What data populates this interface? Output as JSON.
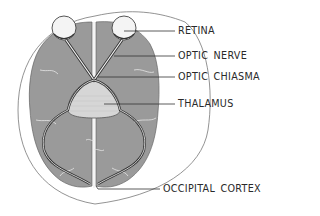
{
  "diagram": {
    "colors": {
      "background": "#ffffff",
      "brain_fill": "#9a9a9a",
      "sulci": "#e8e8e8",
      "outline": "#555555",
      "thalamus_fill": "#d6d6d6",
      "label_text": "#2a2a2a",
      "leader_line": "#333333"
    },
    "labels": [
      {
        "id": "retina",
        "text": "RETINA"
      },
      {
        "id": "optic-nerve",
        "text": "OPTIC NERVE"
      },
      {
        "id": "optic-chiasma",
        "text": "OPTIC CHIASMA"
      },
      {
        "id": "thalamus",
        "text": "THALAMUS"
      },
      {
        "id": "occipital-cortex",
        "text": "OCCIPITAL CORTEX"
      }
    ]
  }
}
